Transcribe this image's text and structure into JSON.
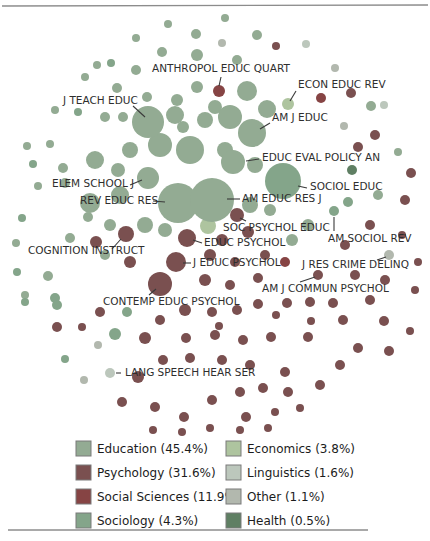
{
  "figure": {
    "width": 430,
    "height": 541,
    "background": "#ffffff"
  },
  "rules": {
    "top": {
      "x1": 2,
      "y1": 6,
      "x2": 428,
      "y2": 5,
      "color": "#8c8c8c",
      "width": 1.4
    },
    "bottom": {
      "x1": 8,
      "y1": 530,
      "x2": 368,
      "y2": 530,
      "color": "#8c8c8c",
      "width": 1.4
    }
  },
  "colors": {
    "edu": "#93ab93",
    "psy": "#7a5050",
    "ssc": "#864444",
    "soc": "#84a58a",
    "eco": "#aec49f",
    "lin": "#bcc7bc",
    "oth": "#b2b8ae",
    "hea": "#5f7f63"
  },
  "legend": {
    "swatch_size": 15,
    "items": [
      {
        "id": "education",
        "label": "Education",
        "pct": "45.4%",
        "display": "Education (45.4%)",
        "color_key": "edu",
        "x": 76,
        "y": 441
      },
      {
        "id": "psychology",
        "label": "Psychology",
        "pct": "31.6%",
        "display": "Psychology (31.6%)",
        "color_key": "psy",
        "x": 76,
        "y": 465
      },
      {
        "id": "social-sciences",
        "label": "Social Sciences",
        "pct": "11.9%",
        "display": "Social Sciences (11.9%)",
        "color_key": "ssc",
        "x": 76,
        "y": 489
      },
      {
        "id": "sociology",
        "label": "Sociology",
        "pct": "4.3%",
        "display": "Sociology (4.3%)",
        "color_key": "soc",
        "x": 76,
        "y": 513
      },
      {
        "id": "economics",
        "label": "Economics",
        "pct": "3.8%",
        "display": "Economics (3.8%)",
        "color_key": "eco",
        "x": 226,
        "y": 441
      },
      {
        "id": "linguistics",
        "label": "Linguistics",
        "pct": "1.6%",
        "display": "Linguistics (1.6%)",
        "color_key": "lin",
        "x": 226,
        "y": 465
      },
      {
        "id": "other",
        "label": "Other",
        "pct": "1.1%",
        "display": "Other (1.1%)",
        "color_key": "oth",
        "x": 226,
        "y": 489
      },
      {
        "id": "health",
        "label": "Health",
        "pct": "0.5%",
        "display": "Health (0.5%)",
        "color_key": "hea",
        "x": 226,
        "y": 513
      }
    ]
  },
  "chart_data": {
    "type": "bubble",
    "title": "",
    "legend_position": "bottom",
    "labeled_points": [
      {
        "name": "ANTHROPOL EDUC QUART",
        "x": 219,
        "y": 91,
        "r": 6,
        "category": "ssc",
        "label_x": 152,
        "label_y": 63,
        "leader": [
          221,
          77,
          219,
          86
        ]
      },
      {
        "name": "ECON EDUC REV",
        "x": 288,
        "y": 104,
        "r": 6,
        "category": "eco",
        "label_x": 298,
        "label_y": 79,
        "leader": [
          296,
          91,
          290,
          101
        ]
      },
      {
        "name": "J TEACH EDUC",
        "x": 148,
        "y": 122,
        "r": 16,
        "category": "edu",
        "label_x": 63,
        "label_y": 95,
        "leader": [
          133,
          106,
          145,
          117
        ]
      },
      {
        "name": "AM J EDUC",
        "x": 252,
        "y": 133,
        "r": 14,
        "category": "edu",
        "label_x": 272,
        "label_y": 112,
        "leader": [
          270,
          123,
          260,
          129
        ]
      },
      {
        "name": "EDUC EVAL POLICY AN",
        "x": 233,
        "y": 162,
        "r": 12,
        "category": "edu",
        "label_x": 262,
        "label_y": 152,
        "leader": [
          259,
          159,
          246,
          161
        ]
      },
      {
        "name": "SOCIOL EDUC",
        "x": 283,
        "y": 181,
        "r": 18,
        "category": "soc",
        "label_x": 310,
        "label_y": 181,
        "leader": [
          307,
          188,
          298,
          186
        ]
      },
      {
        "name": "ELEM SCHOOL J",
        "x": 148,
        "y": 178,
        "r": 11,
        "category": "edu",
        "label_x": 52,
        "label_y": 178,
        "leader": [
          130,
          185,
          142,
          180
        ]
      },
      {
        "name": "REV EDUC RES",
        "x": 178,
        "y": 203,
        "r": 20,
        "category": "edu",
        "label_x": 80,
        "label_y": 195,
        "leader": [
          153,
          201,
          165,
          202
        ]
      },
      {
        "name": "AM EDUC RES J",
        "x": 212,
        "y": 200,
        "r": 22,
        "category": "edu",
        "label_x": 242,
        "label_y": 193,
        "leader": [
          240,
          199,
          227,
          199
        ]
      },
      {
        "name": "SOC PSYCHOL EDUC",
        "x": 237,
        "y": 215,
        "r": 7,
        "category": "psy",
        "label_x": 223,
        "label_y": 222,
        "leader": [
          246,
          221,
          240,
          218
        ]
      },
      {
        "name": "AM SOCIOL REV",
        "x": 334,
        "y": 211,
        "r": 5,
        "category": "soc",
        "label_x": 328,
        "label_y": 233,
        "leader": [
          334,
          231,
          334,
          217
        ]
      },
      {
        "name": "EDUC PSYCHOL",
        "x": 187,
        "y": 238,
        "r": 9,
        "category": "psy",
        "label_x": 204,
        "label_y": 237,
        "leader": [
          202,
          243,
          193,
          240
        ]
      },
      {
        "name": "COGNITION INSTRUCT",
        "x": 126,
        "y": 234,
        "r": 8,
        "category": "psy",
        "label_x": 28,
        "label_y": 245,
        "leader": [
          112,
          249,
          121,
          239
        ]
      },
      {
        "name": "J EDUC PSYCHOL",
        "x": 176,
        "y": 262,
        "r": 10,
        "category": "psy",
        "label_x": 193,
        "label_y": 257,
        "leader": [
          191,
          263,
          183,
          263
        ]
      },
      {
        "name": "J RES CRIME DELINQ",
        "x": 389,
        "y": 255,
        "r": 5,
        "category": "oth",
        "label_x": 302,
        "label_y": 259,
        "leader": [
          377,
          260,
          386,
          257
        ]
      },
      {
        "name": "AM J COMMUN PSYCHOL",
        "x": 318,
        "y": 275,
        "r": 5,
        "category": "psy",
        "label_x": 262,
        "label_y": 283,
        "leader": [
          300,
          282,
          315,
          277
        ]
      },
      {
        "name": "CONTEMP EDUC PSYCHOL",
        "x": 160,
        "y": 284,
        "r": 12,
        "category": "psy",
        "label_x": 103,
        "label_y": 296,
        "leader": [
          149,
          295,
          156,
          289
        ]
      },
      {
        "name": "LANG SPEECH HEAR SER",
        "x": 110,
        "y": 373,
        "r": 5,
        "category": "lin",
        "label_x": 125,
        "label_y": 367,
        "leader": [
          121,
          373,
          116,
          373
        ]
      }
    ],
    "background_points": [
      [
        168,
        24,
        4,
        "edu"
      ],
      [
        196,
        34,
        5,
        "edu"
      ],
      [
        136,
        38,
        4,
        "edu"
      ],
      [
        162,
        52,
        5,
        "edu"
      ],
      [
        197,
        55,
        6,
        "edu"
      ],
      [
        225,
        18,
        4,
        "edu"
      ],
      [
        257,
        35,
        5,
        "edu"
      ],
      [
        222,
        43,
        4,
        "oth"
      ],
      [
        276,
        46,
        4,
        "psy"
      ],
      [
        306,
        44,
        4,
        "lin"
      ],
      [
        237,
        60,
        5,
        "edu"
      ],
      [
        97,
        65,
        4,
        "edu"
      ],
      [
        111,
        63,
        4,
        "soc"
      ],
      [
        136,
        70,
        5,
        "edu"
      ],
      [
        85,
        77,
        4,
        "edu"
      ],
      [
        117,
        88,
        5,
        "edu"
      ],
      [
        147,
        97,
        5,
        "edu"
      ],
      [
        177,
        100,
        6,
        "edu"
      ],
      [
        197,
        87,
        6,
        "edu"
      ],
      [
        55,
        110,
        4,
        "edu"
      ],
      [
        78,
        112,
        4,
        "soc"
      ],
      [
        105,
        117,
        5,
        "edu"
      ],
      [
        123,
        117,
        5,
        "edu"
      ],
      [
        183,
        127,
        6,
        "edu"
      ],
      [
        215,
        107,
        7,
        "edu"
      ],
      [
        247,
        91,
        10,
        "edu"
      ],
      [
        230,
        117,
        12,
        "edu"
      ],
      [
        267,
        109,
        9,
        "edu"
      ],
      [
        321,
        98,
        5,
        "ssc"
      ],
      [
        351,
        93,
        5,
        "psy"
      ],
      [
        371,
        106,
        5,
        "edu"
      ],
      [
        335,
        68,
        4,
        "oth"
      ],
      [
        384,
        105,
        4,
        "lin"
      ],
      [
        344,
        126,
        4,
        "oth"
      ],
      [
        375,
        135,
        5,
        "psy"
      ],
      [
        27,
        146,
        4,
        "edu"
      ],
      [
        50,
        144,
        4,
        "edu"
      ],
      [
        33,
        164,
        4,
        "soc"
      ],
      [
        63,
        168,
        5,
        "edu"
      ],
      [
        38,
        186,
        4,
        "edu"
      ],
      [
        22,
        218,
        4,
        "soc"
      ],
      [
        16,
        243,
        4,
        "edu"
      ],
      [
        17,
        272,
        4,
        "soc"
      ],
      [
        48,
        276,
        5,
        "edu"
      ],
      [
        25,
        295,
        4,
        "edu"
      ],
      [
        55,
        298,
        5,
        "soc"
      ],
      [
        95,
        160,
        9,
        "edu"
      ],
      [
        90,
        203,
        10,
        "edu"
      ],
      [
        65,
        183,
        5,
        "edu"
      ],
      [
        88,
        217,
        5,
        "edu"
      ],
      [
        70,
        238,
        5,
        "edu"
      ],
      [
        96,
        242,
        6,
        "psy"
      ],
      [
        358,
        147,
        5,
        "psy"
      ],
      [
        398,
        152,
        4,
        "edu"
      ],
      [
        352,
        170,
        5,
        "hea"
      ],
      [
        411,
        173,
        5,
        "psy"
      ],
      [
        348,
        202,
        5,
        "soc"
      ],
      [
        405,
        200,
        5,
        "psy"
      ],
      [
        378,
        195,
        5,
        "edu"
      ],
      [
        370,
        225,
        5,
        "psy"
      ],
      [
        402,
        235,
        4,
        "psy"
      ],
      [
        345,
        245,
        5,
        "psy"
      ],
      [
        418,
        262,
        4,
        "psy"
      ],
      [
        355,
        275,
        5,
        "psy"
      ],
      [
        385,
        280,
        5,
        "psy"
      ],
      [
        415,
        290,
        4,
        "psy"
      ],
      [
        175,
        115,
        9,
        "edu"
      ],
      [
        205,
        120,
        8,
        "edu"
      ],
      [
        160,
        145,
        12,
        "edu"
      ],
      [
        130,
        150,
        8,
        "edu"
      ],
      [
        190,
        150,
        14,
        "edu"
      ],
      [
        225,
        150,
        8,
        "edu"
      ],
      [
        255,
        165,
        8,
        "edu"
      ],
      [
        118,
        170,
        7,
        "edu"
      ],
      [
        120,
        195,
        9,
        "edu"
      ],
      [
        250,
        205,
        8,
        "edu"
      ],
      [
        270,
        210,
        6,
        "edu"
      ],
      [
        145,
        225,
        8,
        "edu"
      ],
      [
        165,
        230,
        7,
        "edu"
      ],
      [
        110,
        225,
        6,
        "edu"
      ],
      [
        208,
        226,
        8,
        "eco"
      ],
      [
        222,
        240,
        6,
        "psy"
      ],
      [
        248,
        232,
        6,
        "psy"
      ],
      [
        210,
        255,
        6,
        "psy"
      ],
      [
        235,
        262,
        5,
        "psy"
      ],
      [
        265,
        255,
        5,
        "psy"
      ],
      [
        205,
        280,
        6,
        "psy"
      ],
      [
        230,
        285,
        5,
        "psy"
      ],
      [
        258,
        278,
        5,
        "psy"
      ],
      [
        285,
        262,
        5,
        "ssc"
      ],
      [
        292,
        240,
        6,
        "edu"
      ],
      [
        308,
        225,
        6,
        "edu"
      ],
      [
        130,
        262,
        6,
        "psy"
      ],
      [
        105,
        255,
        5,
        "edu"
      ],
      [
        25,
        302,
        4,
        "soc"
      ],
      [
        57,
        305,
        5,
        "soc"
      ],
      [
        57,
        327,
        5,
        "psy"
      ],
      [
        82,
        327,
        4,
        "psy"
      ],
      [
        100,
        312,
        5,
        "psy"
      ],
      [
        127,
        312,
        5,
        "soc"
      ],
      [
        115,
        334,
        6,
        "soc"
      ],
      [
        145,
        338,
        6,
        "psy"
      ],
      [
        98,
        345,
        4,
        "oth"
      ],
      [
        185,
        310,
        6,
        "psy"
      ],
      [
        212,
        312,
        5,
        "psy"
      ],
      [
        237,
        310,
        5,
        "psy"
      ],
      [
        258,
        304,
        5,
        "psy"
      ],
      [
        287,
        303,
        5,
        "psy"
      ],
      [
        310,
        302,
        5,
        "psy"
      ],
      [
        333,
        303,
        5,
        "psy"
      ],
      [
        160,
        320,
        5,
        "psy"
      ],
      [
        186,
        338,
        5,
        "psy"
      ],
      [
        215,
        335,
        5,
        "psy"
      ],
      [
        243,
        340,
        5,
        "psy"
      ],
      [
        271,
        337,
        5,
        "psy"
      ],
      [
        308,
        337,
        5,
        "psy"
      ],
      [
        343,
        320,
        5,
        "psy"
      ],
      [
        384,
        321,
        5,
        "psy"
      ],
      [
        410,
        331,
        4,
        "psy"
      ],
      [
        358,
        348,
        5,
        "psy"
      ],
      [
        389,
        351,
        5,
        "psy"
      ],
      [
        65,
        359,
        4,
        "soc"
      ],
      [
        84,
        380,
        4,
        "oth"
      ],
      [
        138,
        377,
        6,
        "psy"
      ],
      [
        163,
        360,
        5,
        "psy"
      ],
      [
        190,
        358,
        5,
        "psy"
      ],
      [
        122,
        402,
        5,
        "psy"
      ],
      [
        155,
        407,
        5,
        "psy"
      ],
      [
        184,
        417,
        5,
        "psy"
      ],
      [
        212,
        400,
        5,
        "psy"
      ],
      [
        240,
        392,
        5,
        "psy"
      ],
      [
        263,
        388,
        5,
        "psy"
      ],
      [
        288,
        392,
        5,
        "psy"
      ],
      [
        320,
        385,
        5,
        "psy"
      ],
      [
        340,
        365,
        5,
        "psy"
      ],
      [
        250,
        365,
        5,
        "psy"
      ],
      [
        285,
        372,
        5,
        "psy"
      ],
      [
        222,
        360,
        5,
        "psy"
      ],
      [
        246,
        417,
        5,
        "psy"
      ],
      [
        275,
        412,
        4,
        "psy"
      ],
      [
        300,
        408,
        4,
        "psy"
      ],
      [
        210,
        428,
        4,
        "psy"
      ],
      [
        240,
        430,
        4,
        "psy"
      ],
      [
        268,
        428,
        4,
        "psy"
      ],
      [
        153,
        430,
        4,
        "psy"
      ],
      [
        182,
        432,
        4,
        "psy"
      ],
      [
        370,
        300,
        5,
        "psy"
      ],
      [
        219,
        326,
        4,
        "psy"
      ],
      [
        276,
        315,
        4,
        "psy"
      ],
      [
        311,
        321,
        4,
        "psy"
      ]
    ]
  }
}
